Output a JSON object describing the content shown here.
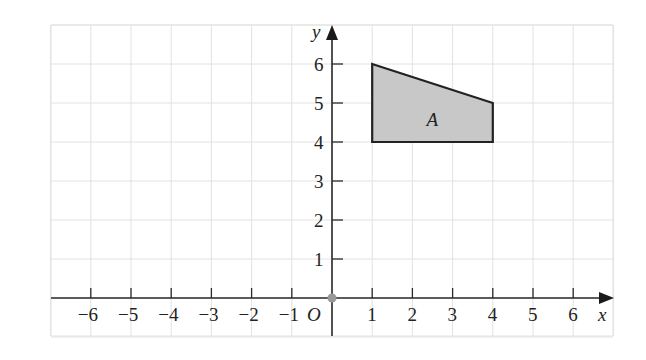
{
  "diagram": {
    "type": "coordinate-grid",
    "x_axis": {
      "label": "x",
      "min": -7,
      "max": 7,
      "ticks": [
        -6,
        -5,
        -4,
        -3,
        -2,
        -1,
        1,
        2,
        3,
        4,
        5,
        6
      ],
      "tick_labels": [
        "−6",
        "−5",
        "−4",
        "−3",
        "−2",
        "−1",
        "1",
        "2",
        "3",
        "4",
        "5",
        "6"
      ]
    },
    "y_axis": {
      "label": "y",
      "min": -1,
      "max": 7,
      "ticks": [
        1,
        2,
        3,
        4,
        5,
        6
      ],
      "tick_labels": [
        "1",
        "2",
        "3",
        "4",
        "5",
        "6"
      ]
    },
    "origin_label": "O",
    "shapes": [
      {
        "label": "A",
        "vertices": [
          [
            1,
            6
          ],
          [
            4,
            5
          ],
          [
            4,
            4
          ],
          [
            1,
            4
          ]
        ],
        "fill": "#c8c8c8",
        "stroke": "#222222"
      }
    ],
    "colors": {
      "grid": "#e2e2e2",
      "axis": "#2a2a2a",
      "origin_dot": "#999999"
    }
  }
}
